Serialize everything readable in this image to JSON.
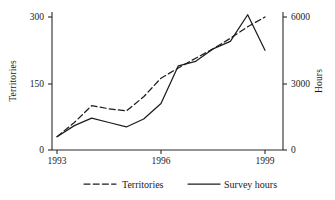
{
  "chart_data": {
    "type": "line",
    "title": "",
    "xlabel": "",
    "ylabel": "Territories",
    "y2label": "Hours",
    "x": [
      1993,
      1993.5,
      1994,
      1994.5,
      1995,
      1995.5,
      1996,
      1996.5,
      1997,
      1997.5,
      1998,
      1998.5,
      1999
    ],
    "xlim": [
      1993,
      1999
    ],
    "xticks": [
      1993,
      1996,
      1999
    ],
    "xtick_labels": [
      "1993",
      "1996",
      "1999"
    ],
    "ylim": [
      0,
      320
    ],
    "yticks": [
      0,
      150,
      300
    ],
    "ytick_labels": [
      "0",
      "150",
      "300"
    ],
    "y2lim": [
      0,
      6400
    ],
    "y2ticks": [
      0,
      3000,
      6000
    ],
    "y2tick_labels": [
      "0",
      "3000",
      "6000"
    ],
    "grid": false,
    "legend_position": "bottom",
    "series": [
      {
        "name": "Territories",
        "axis": "left",
        "style": "dashed",
        "color": "#1d1d1d",
        "values": [
          30,
          62,
          100,
          93,
          88,
          120,
          162,
          185,
          207,
          228,
          252,
          278,
          300
        ]
      },
      {
        "name": "Survey hours",
        "axis": "right",
        "style": "solid",
        "color": "#1d1d1d",
        "values_left_scale": [
          30,
          55,
          72,
          62,
          52,
          70,
          105,
          190,
          200,
          228,
          245,
          305,
          225
        ],
        "values": [
          600,
          1100,
          1440,
          1240,
          1040,
          1400,
          2100,
          3800,
          4000,
          4560,
          4900,
          6100,
          4500
        ]
      }
    ],
    "legend": [
      {
        "label": "Territories",
        "style": "dashed"
      },
      {
        "label": "Survey hours",
        "style": "solid"
      }
    ]
  }
}
